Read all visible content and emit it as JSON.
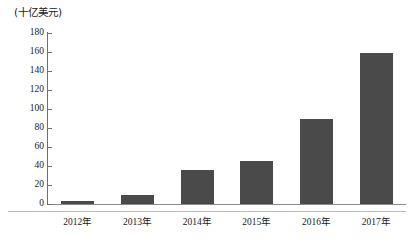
{
  "chart_data": {
    "type": "bar",
    "title": "",
    "subtitle": "",
    "xlabel": "",
    "ylabel": "(十亿美元)",
    "unit_caption": "(十亿美元)",
    "categories": [
      "2012年",
      "2013年",
      "2014年",
      "2015年",
      "2016年",
      "2017年"
    ],
    "values": [
      3,
      9,
      36,
      45,
      89,
      159
    ],
    "series": [
      {
        "name": "",
        "values": [
          3,
          9,
          36,
          45,
          89,
          159
        ]
      }
    ],
    "ylim": [
      0,
      180
    ],
    "ytick_step": 20,
    "yticks": [
      0,
      20,
      40,
      60,
      80,
      100,
      120,
      140,
      160,
      180
    ],
    "ytick_labels": [
      "0",
      "20",
      "40",
      "60",
      "80",
      "100",
      "120",
      "140",
      "160",
      "180"
    ],
    "grid": false,
    "legend": null,
    "legend_position": "none",
    "annotations": [],
    "colors": {
      "bar_fill": "#4a4a4a",
      "axis_line": "#6f6f6f",
      "baseline_rule": "#b9b9b9",
      "text": "#1a1a1a",
      "background": "#ffffff"
    }
  }
}
